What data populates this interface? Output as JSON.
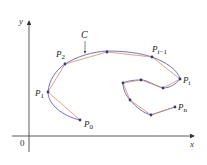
{
  "diagram": {
    "colors": {
      "axis": "#333333",
      "curve": "#5a67b8",
      "polygon": "#d98a6a",
      "point": "#2a3a7a",
      "text": "#222222"
    },
    "axes": {
      "x_label": "x",
      "y_label": "y",
      "origin_label": "0"
    },
    "curve_label": "C",
    "points": [
      {
        "name": "P",
        "sub": "0",
        "x": 80,
        "y": 120
      },
      {
        "name": "P",
        "sub": "1",
        "x": 48,
        "y": 92
      },
      {
        "name": "P",
        "sub": "2",
        "x": 65,
        "y": 64
      },
      {
        "name": "",
        "sub": "",
        "x": 107,
        "y": 52
      },
      {
        "name": "P",
        "sub": "i−1",
        "x": 152,
        "y": 57
      },
      {
        "name": "P",
        "sub": "i",
        "x": 180,
        "y": 79
      },
      {
        "name": "",
        "sub": "",
        "x": 163,
        "y": 88
      },
      {
        "name": "",
        "sub": "",
        "x": 141,
        "y": 80
      },
      {
        "name": "",
        "sub": "",
        "x": 123,
        "y": 83
      },
      {
        "name": "",
        "sub": "",
        "x": 130,
        "y": 100
      },
      {
        "name": "",
        "sub": "",
        "x": 151,
        "y": 115
      },
      {
        "name": "P",
        "sub": "n",
        "x": 175,
        "y": 107
      }
    ],
    "labels": {
      "p0": {
        "main": "P",
        "sub": "0"
      },
      "p1": {
        "main": "P",
        "sub": "1"
      },
      "p2": {
        "main": "P",
        "sub": "2"
      },
      "pim1": {
        "main": "P",
        "sub": "i−1"
      },
      "pi": {
        "main": "P",
        "sub": "i"
      },
      "pn": {
        "main": "P",
        "sub": "n"
      }
    }
  }
}
